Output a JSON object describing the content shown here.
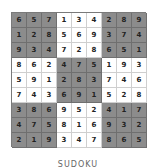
{
  "puzzle": {
    "rows": [
      [
        6,
        5,
        7,
        1,
        3,
        4,
        2,
        8,
        9
      ],
      [
        1,
        2,
        8,
        5,
        6,
        9,
        3,
        7,
        4
      ],
      [
        9,
        3,
        4,
        7,
        2,
        8,
        6,
        5,
        1
      ],
      [
        8,
        6,
        2,
        4,
        7,
        5,
        1,
        9,
        3
      ],
      [
        5,
        9,
        1,
        2,
        8,
        3,
        7,
        4,
        6
      ],
      [
        7,
        4,
        3,
        6,
        9,
        1,
        5,
        2,
        8
      ],
      [
        3,
        8,
        6,
        9,
        5,
        2,
        4,
        1,
        7
      ],
      [
        4,
        7,
        5,
        8,
        1,
        6,
        9,
        3,
        2
      ],
      [
        2,
        1,
        9,
        3,
        4,
        7,
        8,
        6,
        5
      ]
    ],
    "shaded_boxes": [
      [
        0,
        0
      ],
      [
        0,
        2
      ],
      [
        1,
        1
      ],
      [
        2,
        0
      ],
      [
        2,
        2
      ]
    ],
    "colors": {
      "shaded": "#8c8c8c",
      "plain": "#ffffff",
      "digit": "#222222"
    }
  },
  "caption": "SUDOKU"
}
